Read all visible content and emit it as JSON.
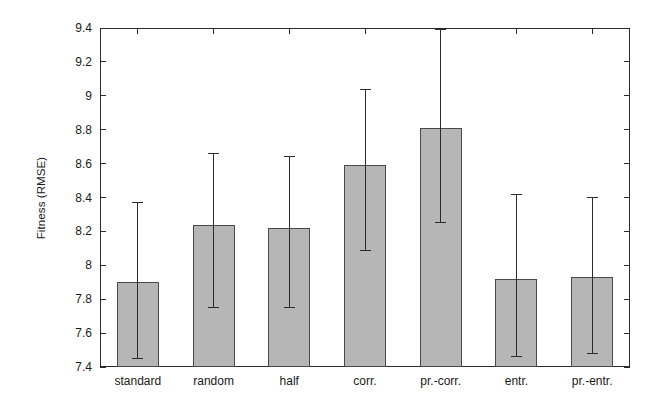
{
  "chart_data": {
    "type": "bar",
    "title": "",
    "xlabel": "",
    "ylabel": "Fitness (RMSE)",
    "categories": [
      "standard",
      "random",
      "half",
      "corr.",
      "pr.-corr.",
      "entr.",
      "pr.-entr."
    ],
    "values": [
      7.9,
      8.24,
      8.22,
      8.59,
      8.81,
      7.92,
      7.93
    ],
    "error_low": [
      7.45,
      7.75,
      7.75,
      8.09,
      8.25,
      7.46,
      7.48
    ],
    "error_high": [
      8.37,
      8.66,
      8.64,
      9.04,
      9.39,
      8.42,
      8.4
    ],
    "ylim": [
      7.4,
      9.4
    ],
    "ytick_labels": [
      "9.4",
      "9.2",
      "9",
      "8.8",
      "8.6",
      "8.4",
      "8.2",
      "8",
      "7.8",
      "7.6",
      "7.4"
    ],
    "ytick_values": [
      9.4,
      9.2,
      9.0,
      8.8,
      8.6,
      8.4,
      8.2,
      8.0,
      7.8,
      7.6,
      7.4
    ],
    "grid": false,
    "legend": false,
    "legend_position": "none",
    "bar_color": "#b6b6b6",
    "bar_edge_color": "#4a4a4a",
    "error_bar_color": "#2b2b2b",
    "axis_color": "#2b2b2b",
    "background_color": "#ffffff",
    "series": [
      {
        "name": "Fitness (RMSE)",
        "values": [
          7.9,
          8.24,
          8.22,
          8.59,
          8.81,
          7.92,
          7.93
        ]
      }
    ]
  }
}
